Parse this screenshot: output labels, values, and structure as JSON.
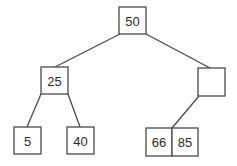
{
  "diagram": {
    "type": "tree",
    "title": "",
    "nodes": [
      {
        "id": "n50",
        "keys": [
          "50"
        ],
        "x": 119,
        "y": 7,
        "w": 27,
        "h": 27
      },
      {
        "id": "n25",
        "keys": [
          "25"
        ],
        "x": 41,
        "y": 67,
        "w": 27,
        "h": 27
      },
      {
        "id": "nempty",
        "keys": [
          ""
        ],
        "x": 198,
        "y": 68,
        "w": 27,
        "h": 28
      },
      {
        "id": "n5",
        "keys": [
          "5"
        ],
        "x": 14,
        "y": 127,
        "w": 27,
        "h": 27
      },
      {
        "id": "n40",
        "keys": [
          "40"
        ],
        "x": 67,
        "y": 127,
        "w": 27,
        "h": 27
      },
      {
        "id": "n66_85",
        "keys": [
          "66",
          "85"
        ],
        "x": 146,
        "y": 128,
        "w": 52,
        "h": 28
      }
    ],
    "edges": [
      {
        "from": "n50",
        "to": "n25"
      },
      {
        "from": "n50",
        "to": "nempty"
      },
      {
        "from": "n25",
        "to": "n5"
      },
      {
        "from": "n25",
        "to": "n40"
      },
      {
        "from": "nempty",
        "to": "n66_85"
      }
    ],
    "labels": {
      "root": "50",
      "left_child": "25",
      "right_child": "",
      "leaf_1": "5",
      "leaf_2": "40",
      "leaf_3_key_1": "66",
      "leaf_3_key_2": "85"
    }
  }
}
